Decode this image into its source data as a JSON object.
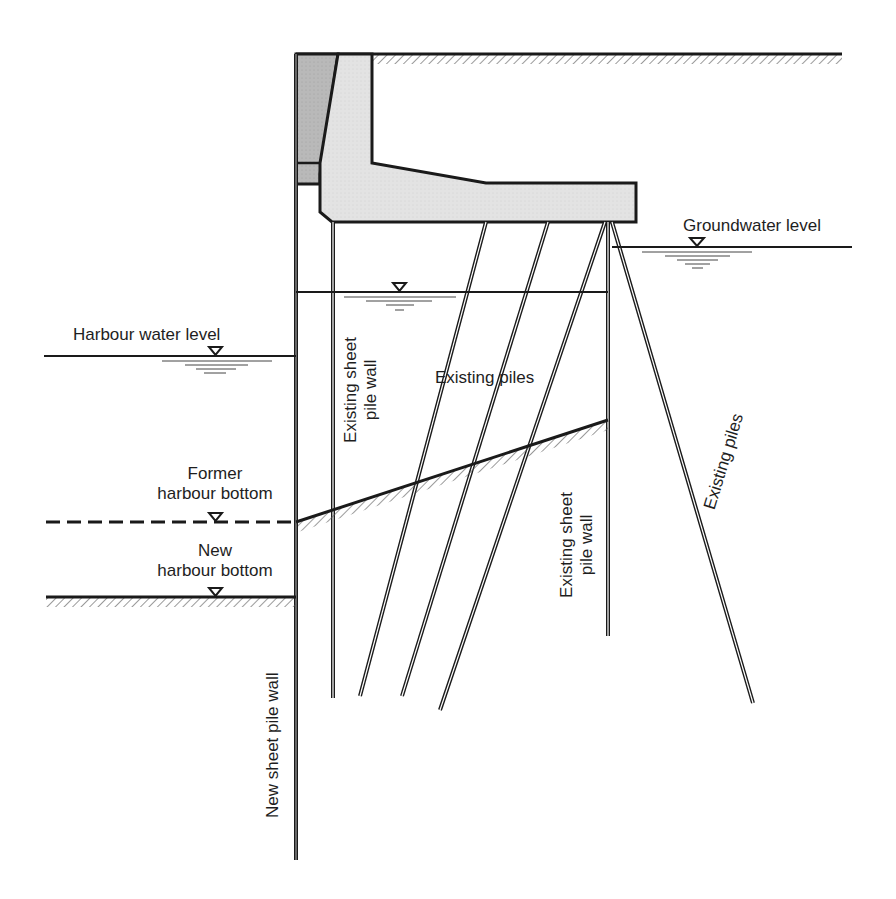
{
  "diagram": {
    "type": "cross-section",
    "colors": {
      "line": "#1a1a1a",
      "concrete_fill": "#e3e3e3",
      "dark_fill": "#b8b8b8",
      "hatch": "#555555"
    },
    "labels": {
      "groundwater_level": "Groundwater level",
      "harbour_water_level": "Harbour water level",
      "existing_piles_center": "Existing piles",
      "existing_sheet_pile_wall_left_line1": "Existing sheet",
      "existing_sheet_pile_wall_left_line2": "pile wall",
      "existing_sheet_pile_wall_right_line1": "Existing sheet",
      "existing_sheet_pile_wall_right_line2": "pile wall",
      "existing_piles_raking": "Existing piles",
      "former_harbour_bottom_line1": "Former",
      "former_harbour_bottom_line2": "harbour bottom",
      "new_harbour_bottom_line1": "New",
      "new_harbour_bottom_line2": "harbour bottom",
      "new_sheet_pile_wall": "New sheet pile wall"
    },
    "water_level_symbol": "inverted-triangle"
  }
}
